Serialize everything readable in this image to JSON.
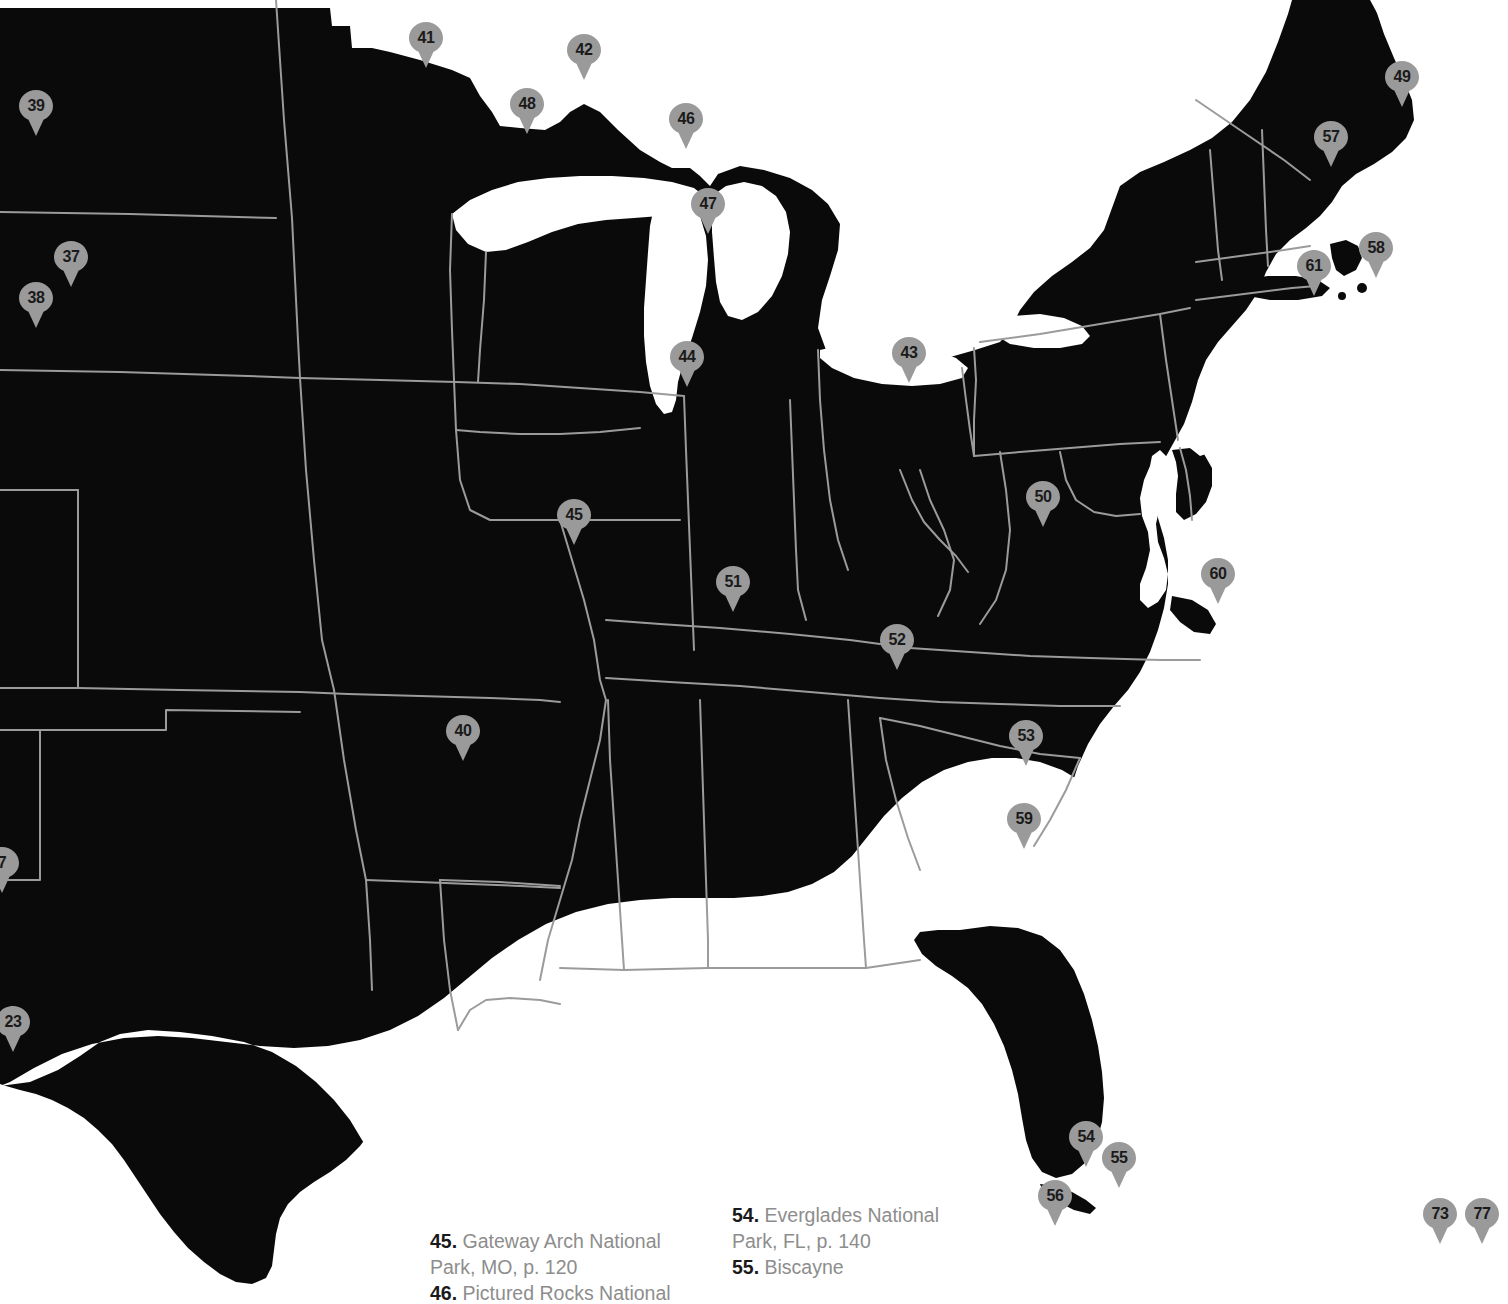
{
  "map": {
    "title": "United States national parks locator map",
    "colors": {
      "land": "#0a0a0a",
      "water": "#ffffff",
      "background": "#ffffff",
      "state_border": "#9b9b9b",
      "pin_fill": "#9a9a9a",
      "pin_text": "#1a1a1a",
      "legend_text": "#8d8d8d",
      "legend_number": "#1a1a1a"
    },
    "markers": [
      {
        "label": "39",
        "x": 36,
        "y": 130
      },
      {
        "label": "37",
        "x": 71,
        "y": 281
      },
      {
        "label": "38",
        "x": 36,
        "y": 322
      },
      {
        "label": "41",
        "x": 426,
        "y": 62
      },
      {
        "label": "42",
        "x": 584,
        "y": 74
      },
      {
        "label": "48",
        "x": 527,
        "y": 128
      },
      {
        "label": "46",
        "x": 686,
        "y": 143
      },
      {
        "label": "47",
        "x": 708,
        "y": 228
      },
      {
        "label": "44",
        "x": 687,
        "y": 381
      },
      {
        "label": "43",
        "x": 909,
        "y": 377
      },
      {
        "label": "49",
        "x": 1402,
        "y": 101
      },
      {
        "label": "57",
        "x": 1331,
        "y": 161
      },
      {
        "label": "58",
        "x": 1376,
        "y": 272
      },
      {
        "label": "61",
        "x": 1314,
        "y": 290
      },
      {
        "label": "50",
        "x": 1043,
        "y": 521
      },
      {
        "label": "60",
        "x": 1218,
        "y": 598
      },
      {
        "label": "45",
        "x": 574,
        "y": 539
      },
      {
        "label": "51",
        "x": 733,
        "y": 606
      },
      {
        "label": "52",
        "x": 897,
        "y": 664
      },
      {
        "label": "53",
        "x": 1026,
        "y": 760
      },
      {
        "label": "59",
        "x": 1024,
        "y": 843
      },
      {
        "label": "40",
        "x": 463,
        "y": 755
      },
      {
        "label": "7",
        "x": 2,
        "y": 887
      },
      {
        "label": "23",
        "x": 13,
        "y": 1046
      },
      {
        "label": "54",
        "x": 1086,
        "y": 1161
      },
      {
        "label": "55",
        "x": 1119,
        "y": 1182
      },
      {
        "label": "56",
        "x": 1055,
        "y": 1220
      },
      {
        "label": "73",
        "x": 1440,
        "y": 1238
      },
      {
        "label": "77",
        "x": 1482,
        "y": 1238
      }
    ]
  },
  "legend": {
    "columns": [
      {
        "entries": [
          {
            "num": "45.",
            "text": " Gateway Arch National Park, MO, p. 120"
          },
          {
            "num": "46.",
            "text": " Pictured Rocks National"
          }
        ]
      },
      {
        "entries": [
          {
            "num": "54.",
            "text": " Everglades National Park, FL, p. 140"
          },
          {
            "num": "55.",
            "text": " Biscayne"
          }
        ]
      }
    ]
  }
}
